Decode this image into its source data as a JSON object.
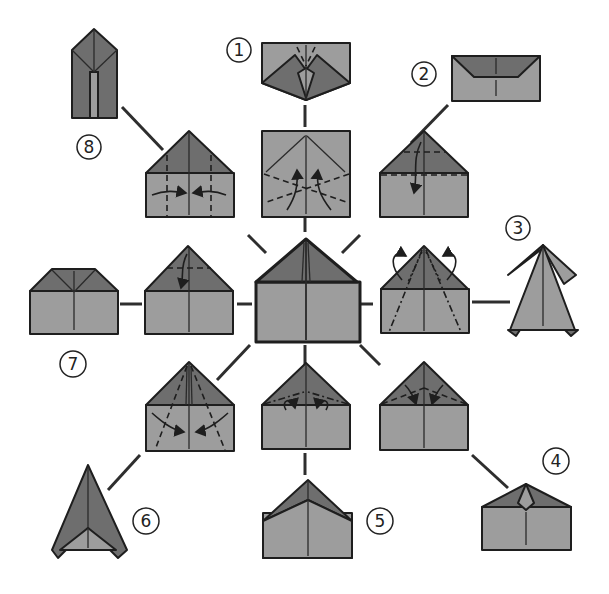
{
  "colors": {
    "paper_light": "#9d9d9d",
    "paper_dark": "#6e6e6e",
    "outline": "#1e1e1e",
    "background": "#ffffff"
  },
  "center": {
    "label": "Base fold (center)"
  },
  "steps": [
    {
      "number": "1",
      "label": "1"
    },
    {
      "number": "2",
      "label": "2"
    },
    {
      "number": "3",
      "label": "3"
    },
    {
      "number": "4",
      "label": "4"
    },
    {
      "number": "5",
      "label": "5"
    },
    {
      "number": "6",
      "label": "6"
    },
    {
      "number": "7",
      "label": "7"
    },
    {
      "number": "8",
      "label": "8"
    }
  ]
}
